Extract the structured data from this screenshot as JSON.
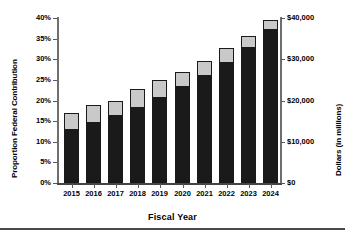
{
  "chart_data": {
    "type": "bar",
    "stacked": true,
    "title": "",
    "xlabel": "Fiscal Year",
    "ylabel": "Proportion Federal Contribution",
    "ylabel_secondary": "Dollars (in millions)",
    "categories": [
      "2015",
      "2016",
      "2017",
      "2018",
      "2019",
      "2020",
      "2021",
      "2022",
      "2023",
      "2024"
    ],
    "series": [
      {
        "name": "Federal contribution (lower segment)",
        "color": "#1a1a1a",
        "values": [
          12.8,
          14.6,
          16.2,
          18.3,
          20.5,
          23.2,
          26.0,
          29.2,
          32.8,
          37.0
        ]
      },
      {
        "name": "Remaining contribution (upper segment)",
        "color": "#c9c9c9",
        "values": [
          4.2,
          4.4,
          3.7,
          4.6,
          4.4,
          3.6,
          3.7,
          3.5,
          2.8,
          2.5
        ]
      }
    ],
    "totals": [
      17.0,
      19.0,
      19.9,
      22.9,
      24.9,
      26.8,
      29.7,
      32.7,
      35.6,
      39.5
    ],
    "ylim": [
      0,
      40
    ],
    "ylim_secondary": [
      0,
      40000
    ],
    "yticks": [
      0,
      5,
      10,
      15,
      20,
      25,
      30,
      35,
      40
    ],
    "yticklabels": [
      "0%",
      "5%",
      "10%",
      "15%",
      "20%",
      "25%",
      "30%",
      "35%",
      "40%"
    ],
    "yticks_secondary": [
      0,
      10000,
      20000,
      30000,
      40000
    ],
    "yticklabels_secondary": [
      "$0",
      "$10,000",
      "$20,000",
      "$30,000",
      "$40,000"
    ],
    "grid": false,
    "legend": null,
    "bar_edge_color": "#1a1a1a"
  }
}
